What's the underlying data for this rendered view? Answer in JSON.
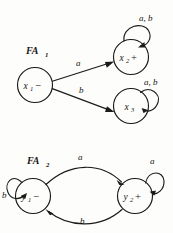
{
  "figure": {
    "background_color": "#fdfdfb",
    "ink_color": "#1a1a18"
  },
  "automata": [
    {
      "id": "FA1",
      "caption": "FA",
      "caption_subscript": "1",
      "states": [
        {
          "id": "x1",
          "label": "x",
          "subscript": "1",
          "mark": "−",
          "mark_meaning": "start-state",
          "cx": 35,
          "cy": 85,
          "r": 17.5
        },
        {
          "id": "x2",
          "label": "x",
          "subscript": "2",
          "mark": "+",
          "mark_meaning": "accept-state",
          "cx": 131,
          "cy": 57,
          "r": 17.5
        },
        {
          "id": "x3",
          "label": "x",
          "subscript": "3",
          "mark": "",
          "mark_meaning": "ordinary-state",
          "cx": 131,
          "cy": 106,
          "r": 17.5
        }
      ],
      "transitions": [
        {
          "from": "x1",
          "to": "x2",
          "symbols": "a",
          "kind": "straight",
          "label_x": 76,
          "label_y": 66
        },
        {
          "from": "x1",
          "to": "x3",
          "symbols": "b",
          "kind": "straight",
          "label_x": 79,
          "label_y": 93
        },
        {
          "from": "x2",
          "to": "x2",
          "symbols": "a, b",
          "kind": "self-loop",
          "label_x": 147,
          "label_y": 20
        },
        {
          "from": "x3",
          "to": "x3",
          "symbols": "a, b",
          "kind": "self-loop",
          "label_x": 152,
          "label_y": 85
        }
      ]
    },
    {
      "id": "FA2",
      "caption": "FA",
      "caption_subscript": "2",
      "states": [
        {
          "id": "y1",
          "label": "y",
          "subscript": "1",
          "mark": "−",
          "mark_meaning": "start-state",
          "cx": 33,
          "cy": 196,
          "r": 17.5
        },
        {
          "id": "y2",
          "label": "y",
          "subscript": "2",
          "mark": "+",
          "mark_meaning": "accept-state",
          "cx": 135,
          "cy": 196,
          "r": 17.5
        }
      ],
      "transitions": [
        {
          "from": "y1",
          "to": "y2",
          "symbols": "a",
          "kind": "curve-top",
          "label_x": 81,
          "label_y": 160
        },
        {
          "from": "y2",
          "to": "y1",
          "symbols": "b",
          "kind": "curve-bottom",
          "label_x": 83,
          "label_y": 224
        },
        {
          "from": "y1",
          "to": "y1",
          "symbols": "b",
          "kind": "self-loop",
          "label_x": 5,
          "label_y": 195
        },
        {
          "from": "y2",
          "to": "y2",
          "symbols": "a",
          "kind": "self-loop",
          "label_x": 153,
          "label_y": 164
        }
      ]
    }
  ],
  "captions": {
    "fa1": {
      "text": "FA",
      "subscript": "1",
      "x": 26,
      "y": 54
    },
    "fa2": {
      "text": "FA",
      "subscript": "2",
      "x": 27,
      "y": 164
    }
  }
}
